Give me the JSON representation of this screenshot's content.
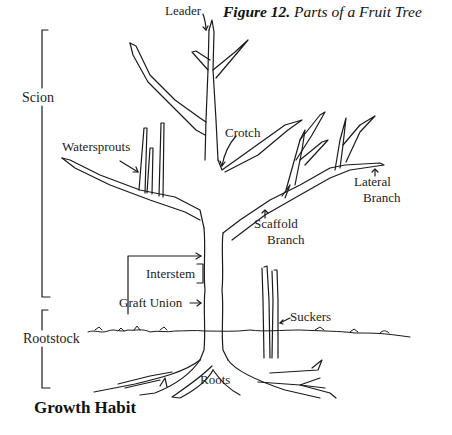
{
  "figure": {
    "caption_number": "Figure 12.",
    "caption_title": " Parts of a Fruit Tree",
    "heading": "Growth Habit"
  },
  "brackets": {
    "scion": "Scion",
    "rootstock": "Rootstock"
  },
  "labels": {
    "leader": "Leader",
    "crotch": "Crotch",
    "watersprouts": "Watersprouts",
    "lateral_branch_1": "Lateral",
    "lateral_branch_2": "Branch",
    "scaffold_branch_1": "Scaffold",
    "scaffold_branch_2": "Branch",
    "interstem": "Interstem",
    "graft_union": "Graft Union",
    "suckers": "Suckers",
    "roots": "Roots"
  },
  "colors": {
    "ink": "#1a1a1a",
    "background": "#ffffff"
  }
}
